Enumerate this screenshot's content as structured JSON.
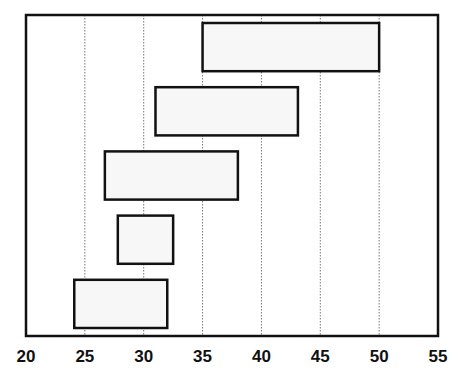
{
  "chart_data": {
    "type": "bar",
    "orientation": "horizontal-floating",
    "title": "",
    "xlabel": "",
    "ylabel": "",
    "xlim": [
      20,
      55
    ],
    "x_ticks": [
      20,
      25,
      30,
      35,
      40,
      45,
      50,
      55
    ],
    "x_tick_labels": [
      "20",
      "25",
      "30",
      "35",
      "40",
      "45",
      "50",
      "55"
    ],
    "grid": "vertical dotted at x ticks",
    "legend": "none",
    "categories": [
      "",
      "",
      "",
      "",
      ""
    ],
    "ranges": [
      {
        "start": 35.0,
        "end": 50.0
      },
      {
        "start": 31.0,
        "end": 43.1
      },
      {
        "start": 26.7,
        "end": 38.0
      },
      {
        "start": 27.8,
        "end": 32.5
      },
      {
        "start": 24.1,
        "end": 32.0
      }
    ],
    "colors": {
      "bar_fill": "#f7f7f7",
      "bar_stroke": "#111111",
      "grid": "#777777",
      "frame": "#111111"
    }
  }
}
